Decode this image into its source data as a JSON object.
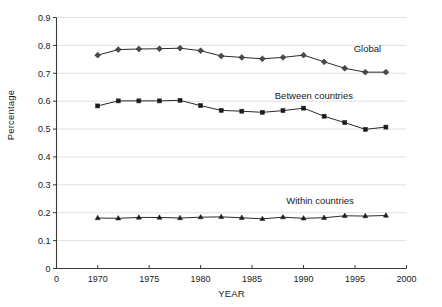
{
  "chart_data": {
    "type": "line",
    "title": "",
    "xlabel": "YEAR",
    "ylabel": "Percentage",
    "xlim": [
      1966,
      2000
    ],
    "ylim": [
      0,
      0.9
    ],
    "grid": true,
    "legend_position": "inline-right",
    "x_tick_labels": [
      "0",
      "1970",
      "1975",
      "1980",
      "1985",
      "1990",
      "1995",
      "2000"
    ],
    "x_tick_values": [
      1966,
      1970,
      1975,
      1980,
      1985,
      1990,
      1995,
      2000
    ],
    "y_tick_labels": [
      "0",
      "0.1",
      "0.2",
      "0.3",
      "0.4",
      "0.5",
      "0.6",
      "0.7",
      "0.8",
      "0.9"
    ],
    "y_tick_values": [
      0,
      0.1,
      0.2,
      0.3,
      0.4,
      0.5,
      0.6,
      0.7,
      0.8,
      0.9
    ],
    "x": [
      1970,
      1972,
      1974,
      1976,
      1978,
      1980,
      1982,
      1984,
      1986,
      1988,
      1990,
      1992,
      1994,
      1996,
      1998
    ],
    "series": [
      {
        "name": "Global",
        "marker": "diamond",
        "color": "#4a4a4a",
        "values": [
          0.765,
          0.785,
          0.787,
          0.788,
          0.79,
          0.781,
          0.762,
          0.757,
          0.752,
          0.757,
          0.765,
          0.741,
          0.718,
          0.704,
          0.704
        ]
      },
      {
        "name": "Between countries",
        "marker": "square",
        "color": "#1a1a1a",
        "values": [
          0.583,
          0.601,
          0.601,
          0.601,
          0.603,
          0.584,
          0.567,
          0.564,
          0.56,
          0.566,
          0.575,
          0.546,
          0.523,
          0.499,
          0.507
        ]
      },
      {
        "name": "Within countries",
        "marker": "triangle",
        "color": "#1a1a1a",
        "values": [
          0.181,
          0.18,
          0.183,
          0.183,
          0.181,
          0.184,
          0.185,
          0.182,
          0.178,
          0.184,
          0.18,
          0.182,
          0.189,
          0.188,
          0.19
        ]
      }
    ],
    "annotations": [
      {
        "text": "Global",
        "x": 1996.2,
        "y": 0.775
      },
      {
        "text": "Between countries",
        "x": 1991.0,
        "y": 0.606
      },
      {
        "text": "Within countries",
        "x": 1991.6,
        "y": 0.232
      }
    ]
  }
}
